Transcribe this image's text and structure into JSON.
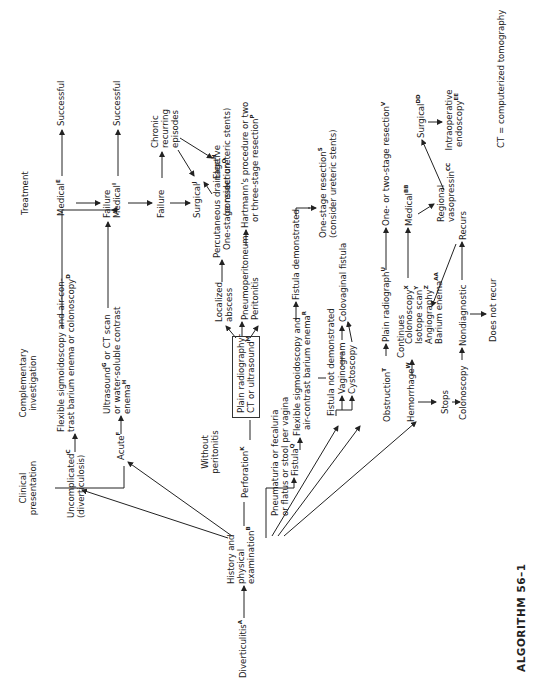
{
  "title": "ALGORITHM 56–1",
  "footnote": "CT = computerized tomography",
  "headers": {
    "clinical": "Clinical presentation",
    "complementary": "Complementary investigation",
    "treatment": "Treatment",
    "without_peritonitis": "Without peritonitis"
  },
  "nodes": {
    "diverticulitis": {
      "text": "Diverticulitis",
      "sup": "A"
    },
    "history_l1": "History and",
    "history_l2": "physical",
    "history_l3": {
      "text": "examination",
      "sup": "B"
    },
    "uncomplicated": {
      "text": "Uncomplicated",
      "sup": "C"
    },
    "uncomplicated_l2": "(diverticulosis)",
    "flex_sig_l1": "Flexible sigmoidoscopy and air-con-",
    "flex_sig_l2": {
      "text": "trast barium enema or colonoscopy",
      "sup": "D"
    },
    "medical_e": {
      "text": "Medical",
      "sup": "E"
    },
    "successful_1": "Successful",
    "failure_1": "Failure",
    "acute": {
      "text": "Acute",
      "sup": "F"
    },
    "ultrasound_l1": {
      "text": "Ultrasound",
      "sup": "G",
      "rest": " or CT scan"
    },
    "ultrasound_l2": "or water-soluble contrast",
    "ultrasound_l3": {
      "text": "enema",
      "sup": "H"
    },
    "medical_i": {
      "text": "Medical",
      "sup": "I"
    },
    "successful_2": "Successful",
    "failure_2": "Failure",
    "chronic_l1": "Chronic",
    "chronic_l2": "recurring",
    "chronic_l3": "episodes",
    "surgical_j": {
      "text": "Surgical",
      "sup": "J"
    },
    "elective_l1": "Elective",
    "elective_l2": "(consider ureteric stents)",
    "perforation": {
      "text": "Perforation",
      "sup": "K"
    },
    "plain_rad_l1": {
      "text": "Plain radiography",
      "sup": "L"
    },
    "plain_rad_l2": {
      "text": "CT or ultrasound",
      "sup": "M"
    },
    "localized_l1": "Localized",
    "localized_l2": "abscess",
    "percutaneous": {
      "text": "Percutaneous drainage",
      "sup": "N"
    },
    "one_stage_o": {
      "text": "One-stage resection",
      "sup": "O"
    },
    "pneumoperitoneum": "Pneumoperitoneum",
    "peritonitis": "Peritonitis",
    "hartmann_l1": "Hartmann's procedure or two",
    "hartmann_l2": {
      "text": "or three-stage resection",
      "sup": "P"
    },
    "pneumaturia_l1": "Pneumaturia or fecaluria",
    "pneumaturia_l2": "or flatus or stool per vagina",
    "fistula": {
      "text": "Fistula",
      "sup": "Q"
    },
    "flex_sig2_l1": "Flexible sigmoidoscopy and",
    "flex_sig2_l2": {
      "text": "air-contrast barium enema",
      "sup": "R"
    },
    "fistula_demonstrated": "Fistula  demonstrated",
    "one_stage_s_l1": {
      "text": "One-stage resection",
      "sup": "S"
    },
    "one_stage_s_l2": "(consider ureteric stents)",
    "fistula_not_demonstrated": "Fistula not demonstrated",
    "vaginogram": "Vaginogram",
    "cystoscopy": "Cystoscopy",
    "colovaginal": "Colovaginal fistula",
    "obstruction": {
      "text": "Obstruction",
      "sup": "T"
    },
    "plain_radiograph": {
      "text": "Plain radiograph",
      "sup": "U"
    },
    "one_two_stage": {
      "text": "One- or two-stage resection",
      "sup": "V"
    },
    "hemorrhage": {
      "text": "Hemorrhage",
      "sup": "W"
    },
    "continues": "Continues",
    "stops": "Stops",
    "colonoscopy_x": {
      "text": "Colonoscopy",
      "sup": "X"
    },
    "isotope": {
      "text": "Isotope scan",
      "sup": "Y"
    },
    "angiography": {
      "text": "Angiography",
      "sup": "Z"
    },
    "barium_enema": {
      "text": "Barium enema",
      "sup": "AA"
    },
    "medical_bb": {
      "text": "Medical",
      "sup": "BB"
    },
    "regional_l1": "Regional",
    "regional_l2": {
      "text": "vasopressin",
      "sup": "CC"
    },
    "surgical_dd": {
      "text": "Surgical",
      "sup": "DD"
    },
    "intraop_l1": "Intraoperative",
    "intraop_l2": {
      "text": "endoscopy",
      "sup": "EE"
    },
    "colonoscopy": "Colonoscopy",
    "nondiagnostic": "Nondiagnostic",
    "recurs": "Recurs",
    "does_not_recur": "Does not recur"
  }
}
